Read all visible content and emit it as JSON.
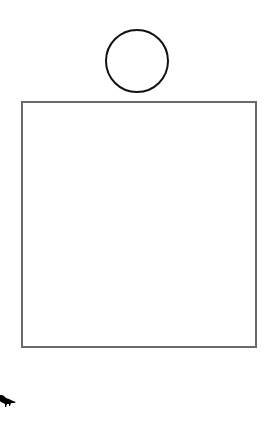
{
  "canvas": {
    "width": 270,
    "height": 430,
    "background": "#ffffff"
  },
  "shapes": [
    {
      "type": "circle",
      "label": "",
      "cx": 136,
      "cy": 60,
      "r": 31,
      "stroke": "#111111"
    },
    {
      "type": "rectangle",
      "label": "",
      "x": 21,
      "y": 101,
      "width": 234,
      "height": 245,
      "stroke": "#6a6a6a"
    }
  ],
  "icons": [
    {
      "name": "animal-silhouette-icon",
      "color": "#000000",
      "x": 0,
      "y": 392
    }
  ]
}
